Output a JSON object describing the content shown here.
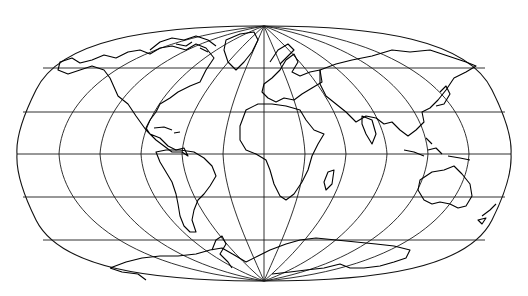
{
  "map": {
    "type": "world-graticule-projection",
    "center_longitude": 0,
    "graticule_spacing_degrees": 30,
    "meridians_longitudes": [
      -180,
      -150,
      -120,
      -90,
      -60,
      -30,
      0,
      30,
      60,
      90,
      120,
      150,
      180
    ],
    "parallels_latitudes": [
      60,
      30,
      0,
      -30,
      -60
    ],
    "colors": {
      "background": "#ffffff",
      "lines": "#1a1a1a",
      "coastline": "#000000"
    },
    "layers": [
      "outline",
      "graticule",
      "coastlines"
    ],
    "continents_shown": [
      "North America",
      "South America",
      "Europe",
      "Africa",
      "Asia",
      "Australia",
      "Antarctica",
      "Greenland"
    ]
  }
}
